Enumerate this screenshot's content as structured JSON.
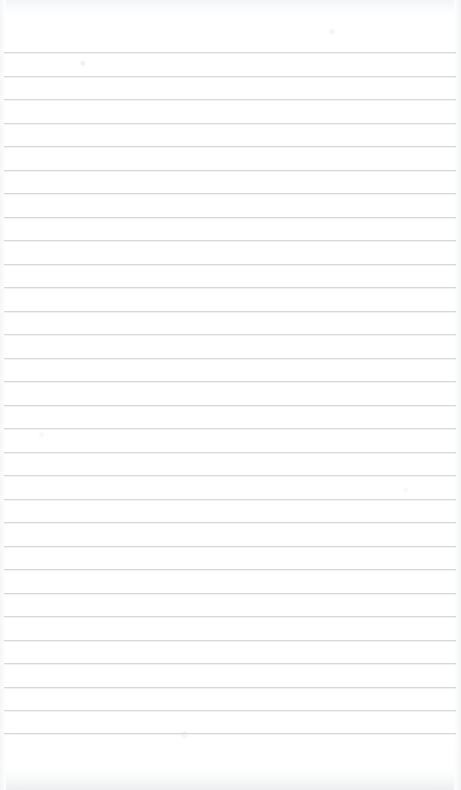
{
  "document": {
    "kind": "lined-notebook-page",
    "title": "",
    "content_text": "",
    "page_background_color": "#ffffff",
    "rule_line_color": "#cfd2d6",
    "edge_shadow_color": "#eceef0"
  },
  "page": {
    "width": 461,
    "height": 790
  },
  "ruling": {
    "line_count": 30,
    "first_line_y": 52,
    "line_spacing": 23.5,
    "line_thickness": 1,
    "line_left_x": 4,
    "line_right_x": 456,
    "top_margin_height": 52,
    "bottom_margin_height": 57,
    "has_vertical_margin_rule": false,
    "has_holes": false
  },
  "lines": [
    {
      "index": 1,
      "y": 52,
      "text": ""
    },
    {
      "index": 2,
      "y": 75.5,
      "text": ""
    },
    {
      "index": 3,
      "y": 99,
      "text": ""
    },
    {
      "index": 4,
      "y": 122.5,
      "text": ""
    },
    {
      "index": 5,
      "y": 146,
      "text": ""
    },
    {
      "index": 6,
      "y": 169.5,
      "text": ""
    },
    {
      "index": 7,
      "y": 193,
      "text": ""
    },
    {
      "index": 8,
      "y": 216.5,
      "text": ""
    },
    {
      "index": 9,
      "y": 240,
      "text": ""
    },
    {
      "index": 10,
      "y": 263.5,
      "text": ""
    },
    {
      "index": 11,
      "y": 287,
      "text": ""
    },
    {
      "index": 12,
      "y": 310.5,
      "text": ""
    },
    {
      "index": 13,
      "y": 334,
      "text": ""
    },
    {
      "index": 14,
      "y": 357.5,
      "text": ""
    },
    {
      "index": 15,
      "y": 381,
      "text": ""
    },
    {
      "index": 16,
      "y": 404.5,
      "text": ""
    },
    {
      "index": 17,
      "y": 428,
      "text": ""
    },
    {
      "index": 18,
      "y": 451.5,
      "text": ""
    },
    {
      "index": 19,
      "y": 475,
      "text": ""
    },
    {
      "index": 20,
      "y": 498.5,
      "text": ""
    },
    {
      "index": 21,
      "y": 522,
      "text": ""
    },
    {
      "index": 22,
      "y": 545.5,
      "text": ""
    },
    {
      "index": 23,
      "y": 569,
      "text": ""
    },
    {
      "index": 24,
      "y": 592.5,
      "text": ""
    },
    {
      "index": 25,
      "y": 616,
      "text": ""
    },
    {
      "index": 26,
      "y": 639.5,
      "text": ""
    },
    {
      "index": 27,
      "y": 663,
      "text": ""
    },
    {
      "index": 28,
      "y": 686.5,
      "text": ""
    },
    {
      "index": 29,
      "y": 710,
      "text": ""
    },
    {
      "index": 30,
      "y": 733,
      "text": ""
    }
  ]
}
